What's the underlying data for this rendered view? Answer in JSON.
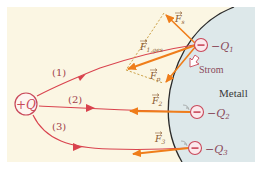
{
  "diagram": {
    "title": "",
    "colors": {
      "background_outer": "#ffffff",
      "insulator_region": "#fbf6e3",
      "metal_region": "#dde8ea",
      "metal_boundary": "#2a2a2a",
      "field_line": "#d9434e",
      "force_arrow": "#ef7d1a",
      "dashed_construction": "#c79a3a",
      "charge_circle": "#c9485a",
      "label_text": "#8a4a5a"
    },
    "source_charge": {
      "label": "+Q"
    },
    "field_lines": [
      {
        "id": "1",
        "label": "(1)"
      },
      {
        "id": "2",
        "label": "(2)"
      },
      {
        "id": "3",
        "label": "(3)"
      }
    ],
    "surface_charges": [
      {
        "label": "−Q",
        "sub": "1",
        "sign": "−"
      },
      {
        "label": "−Q",
        "sub": "2",
        "sign": "−"
      },
      {
        "label": "−Q",
        "sub": "3",
        "sign": "−"
      }
    ],
    "forces": {
      "F1_total": {
        "label": "F",
        "sub": "1,ges"
      },
      "F_s": {
        "label": "F",
        "sub": "s"
      },
      "F_p": {
        "label": "F",
        "sub": "p"
      },
      "F2": {
        "label": "F",
        "sub": "2"
      },
      "F3": {
        "label": "F",
        "sub": "3"
      }
    },
    "current_label": "Strom",
    "metal_label": "Metall"
  }
}
